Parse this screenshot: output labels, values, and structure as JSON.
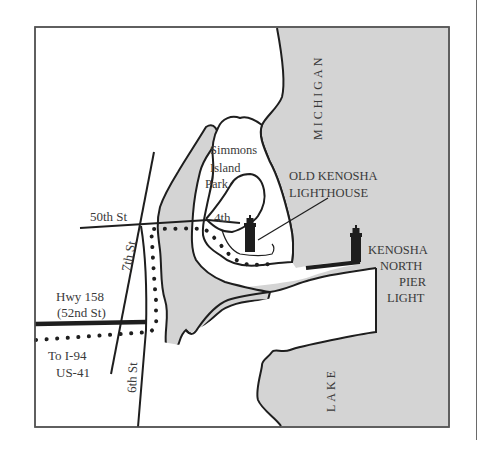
{
  "map": {
    "water_labels": {
      "upper": "MICHIGAN",
      "lower": "LAKE"
    },
    "park_label": [
      "Simmons",
      "Island",
      "Park"
    ],
    "streets": {
      "fiftieth": "50th St",
      "fourth": "4th",
      "seventh": "7th St",
      "sixth": "6th St",
      "hwy_line1": "Hwy 158",
      "hwy_line2": "(52nd St)",
      "to_line1": "To I-94",
      "to_line2": "US-41"
    },
    "landmarks": {
      "old_lighthouse_line1": "OLD KENOSHA",
      "old_lighthouse_line2": "LIGHTHOUSE",
      "pier_light_line1": "KENOSHA",
      "pier_light_line2": "NORTH",
      "pier_light_line3": "PIER",
      "pier_light_line4": "LIGHT"
    },
    "colors": {
      "water": "#d4d4d4",
      "land": "#ffffff",
      "lines": "#1e1e1e",
      "frame": "#555555",
      "text": "#3a3a3a"
    },
    "icons": [
      "lighthouse-icon",
      "lighthouse-icon"
    ]
  }
}
